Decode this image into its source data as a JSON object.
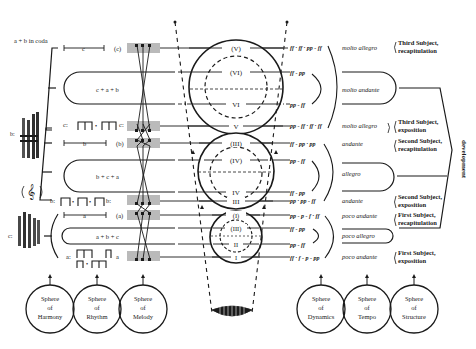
{
  "coda_label": "a + b in coda",
  "themes_left": {
    "top_c": "c",
    "top_c_label": "(c)",
    "c_rhythm_start": "c:",
    "c_rhythm_end": "c:",
    "b_line": "b",
    "b_line_label": "(b)",
    "b_rhythm_start": "b:",
    "b_rhythm_end": "b:",
    "a_line": "a",
    "a_line_label": "(a)",
    "a_rhythm_start": "a:",
    "a_rhythm_end": "a",
    "harmony_b_label": "b:",
    "harmony_c_label": "c:"
  },
  "loops": [
    {
      "label": "c + a + b"
    },
    {
      "label": "b + c + a"
    },
    {
      "label": "a + b + c"
    }
  ],
  "circles": {
    "top": {
      "outer_top": "(V)",
      "inner": "(VI)",
      "inner_bottom": "VI",
      "outer_bottom": "V"
    },
    "middle": {
      "outer_top": "(III)",
      "inner": "(IV)",
      "inner_bottom": "IV",
      "outer_bottom": "III"
    },
    "bottom": {
      "outer_top": "(I)",
      "inner": "(III)",
      "inner_bottom": "II",
      "outer_bottom": "I"
    }
  },
  "dynamics": [
    "ff · ff · pp - ff",
    "ff - pp",
    "pp - ff",
    "pp - ff · ff · ff",
    "ff - pp · pp",
    "pp - ff",
    "ff - pp",
    "pp · pp - ff",
    "pp - p - f · ff",
    "ff - pp",
    "pp - ff",
    "ff · f - p - pp"
  ],
  "tempi": [
    "molto allegro",
    "molto andante",
    "molto allegro",
    "andante",
    "allegro",
    "andante",
    "poco andante",
    "poco allegro",
    "poco andante"
  ],
  "structure": [
    {
      "line1": "Third Subject,",
      "line2": "recapitulation"
    },
    {
      "line1": "Third Subject,",
      "line2": "exposition"
    },
    {
      "line1": "Second Subject,",
      "line2": "recapitulation"
    },
    {
      "line1": "Second Subject,",
      "line2": "exposition"
    },
    {
      "line1": "First Subject,",
      "line2": "recapitulation"
    },
    {
      "line1": "First Subject,",
      "line2": "exposition"
    }
  ],
  "development_label": "development",
  "spheres": [
    {
      "l1": "Sphere",
      "l2": "of",
      "l3": "Harmony"
    },
    {
      "l1": "Sphere",
      "l2": "of",
      "l3": "Rhythm"
    },
    {
      "l1": "Sphere",
      "l2": "of",
      "l3": "Melody"
    },
    {
      "l1": "Sphere",
      "l2": "of",
      "l3": "Dynamics"
    },
    {
      "l1": "Sphere",
      "l2": "of",
      "l3": "Tempo"
    },
    {
      "l1": "Sphere",
      "l2": "of",
      "l3": "Structure"
    }
  ],
  "colors": {
    "ink": "#1a1a1a",
    "paper": "#ffffff"
  }
}
